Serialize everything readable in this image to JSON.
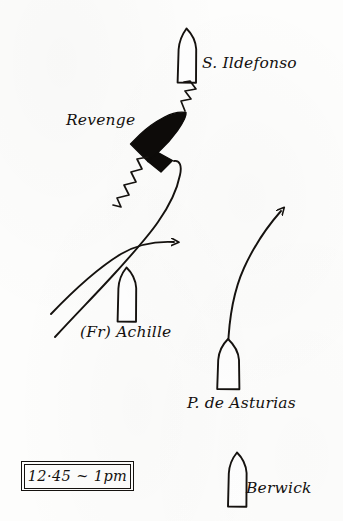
{
  "diagram": {
    "ink_color": "#15120f",
    "paper_color": "#fdfdfc",
    "time_box": {
      "text": "12·45 ~ 1pm"
    },
    "ships": [
      {
        "id": "s-ildefonso",
        "label": "S. Ildefonso",
        "fill": "outline",
        "heading": "up",
        "x": 186,
        "y": 58
      },
      {
        "id": "revenge",
        "label": "Revenge",
        "fill": "solid-black",
        "heading": "up-right-diagonal",
        "x": 160,
        "y": 135
      },
      {
        "id": "fr-achille",
        "label": "(Fr) Achille",
        "fill": "outline",
        "heading": "up",
        "x": 126,
        "y": 296
      },
      {
        "id": "p-de-asturias",
        "label": "P. de Asturias",
        "fill": "outline",
        "heading": "up",
        "x": 228,
        "y": 365
      },
      {
        "id": "berwick",
        "label": "Berwick",
        "fill": "outline",
        "heading": "up",
        "x": 237,
        "y": 482
      }
    ],
    "tracks": [
      {
        "id": "revenge-track",
        "description": "S-curved course from lower-left up to the Revenge",
        "arrowhead": false
      },
      {
        "id": "achille-track",
        "description": "curve from lower-left with arrowhead pointing right",
        "arrowhead": true
      },
      {
        "id": "asturias-track",
        "description": "curve rising from P. de Asturias to upper-right with arrowhead",
        "arrowhead": true
      }
    ],
    "gunfire": [
      {
        "id": "gunfire-upper",
        "description": "zigzag broadside from Revenge toward S. Ildefonso"
      },
      {
        "id": "gunfire-lower",
        "description": "zigzag broadside from Revenge toward lower-left"
      }
    ]
  }
}
